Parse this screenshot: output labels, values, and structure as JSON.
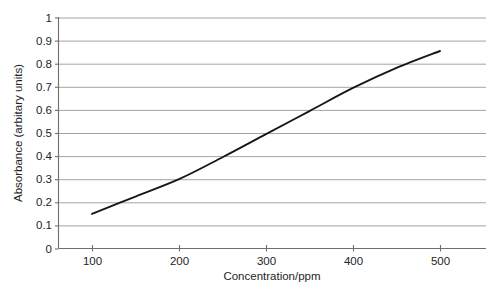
{
  "chart_data": {
    "type": "line",
    "title": "",
    "xlabel": "Concentration/ppm",
    "ylabel": "Absorbance (arbitary units)",
    "xlim": [
      0,
      550
    ],
    "ylim": [
      0,
      1
    ],
    "grid": true,
    "grid_axis": "y",
    "legend": "none",
    "xticks": [
      100,
      200,
      300,
      400,
      500
    ],
    "xtick_labels": [
      "100",
      "200",
      "300",
      "400",
      "500"
    ],
    "yticks": [
      0,
      0.1,
      0.2,
      0.3,
      0.4,
      0.5,
      0.6,
      0.7,
      0.8,
      0.9,
      1
    ],
    "ytick_labels": [
      "0",
      "0.1",
      "0.2",
      "0.3",
      "0.4",
      "0.5",
      "0.6",
      "0.7",
      "0.8",
      "0.9",
      "1"
    ],
    "series": [
      {
        "name": "Calibration curve",
        "color": "#18161a",
        "x": [
          100,
          150,
          200,
          250,
          300,
          350,
          400,
          450,
          500
        ],
        "y": [
          0.15,
          0.225,
          0.3,
          0.395,
          0.495,
          0.595,
          0.695,
          0.782,
          0.855
        ]
      }
    ]
  },
  "axis": {
    "y_title": "Absorbance (arbitary units)",
    "x_title": "Concentration/ppm"
  },
  "ticks": {
    "y": [
      {
        "value": 1,
        "label": "1"
      },
      {
        "value": 0.9,
        "label": "0.9"
      },
      {
        "value": 0.8,
        "label": "0.8"
      },
      {
        "value": 0.7,
        "label": "0.7"
      },
      {
        "value": 0.6,
        "label": "0.6"
      },
      {
        "value": 0.5,
        "label": "0.5"
      },
      {
        "value": 0.4,
        "label": "0.4"
      },
      {
        "value": 0.3,
        "label": "0.3"
      },
      {
        "value": 0.2,
        "label": "0.2"
      },
      {
        "value": 0.1,
        "label": "0.1"
      },
      {
        "value": 0,
        "label": "0"
      }
    ],
    "x": [
      {
        "value": 100,
        "label": "100"
      },
      {
        "value": 200,
        "label": "200"
      },
      {
        "value": 300,
        "label": "300"
      },
      {
        "value": 400,
        "label": "400"
      },
      {
        "value": 500,
        "label": "500"
      }
    ]
  },
  "colors": {
    "background": "#ffffff",
    "gridline": "#9a9a9a",
    "axis": "#6e6e6e",
    "data_line": "#18161a",
    "text": "#221f1f"
  }
}
